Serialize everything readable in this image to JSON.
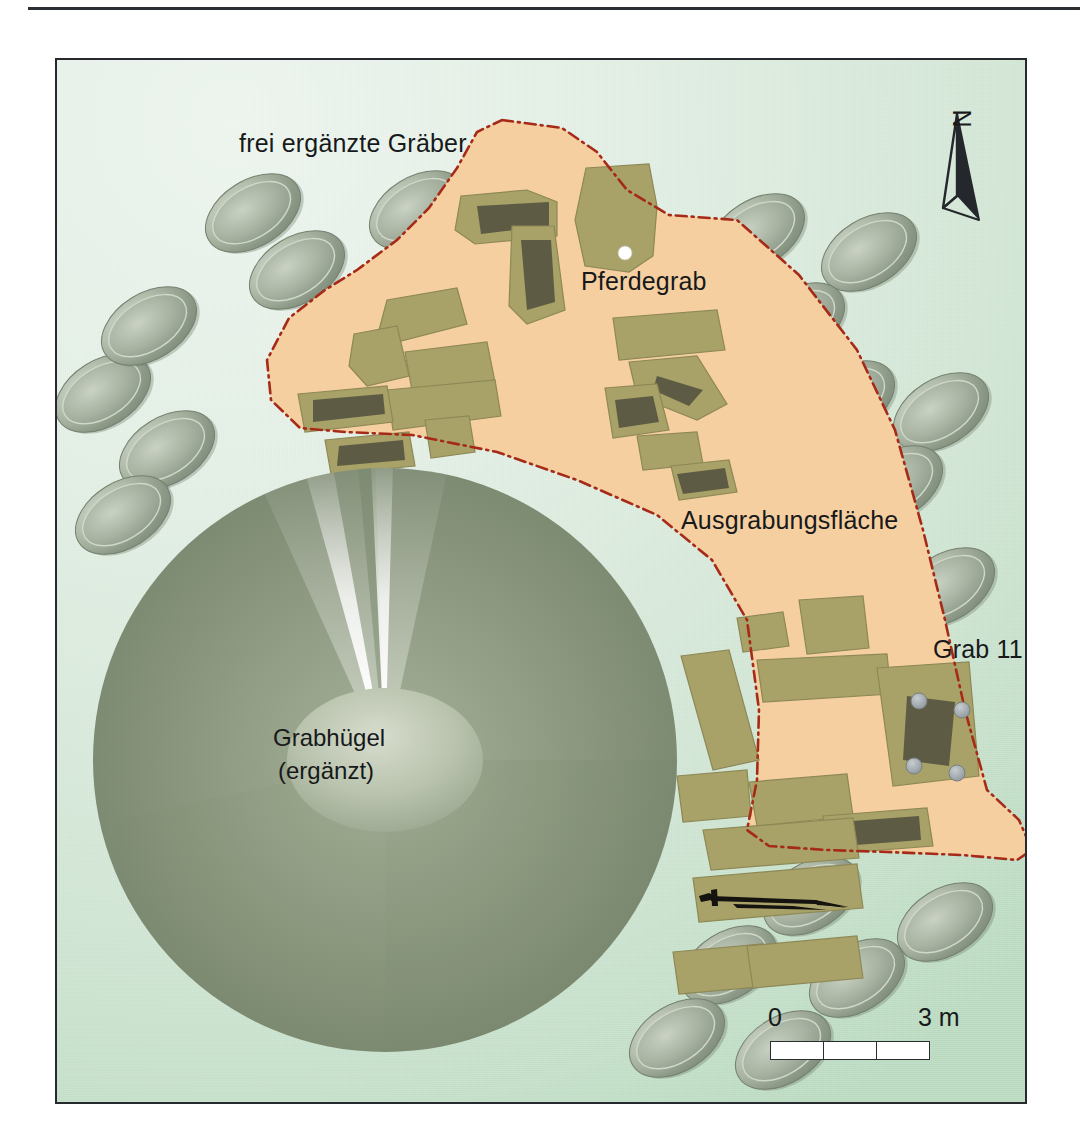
{
  "figure": {
    "kind": "archaeological-site-plan",
    "background_color": "#dbeade",
    "frame_color": "#26292d"
  },
  "labels": {
    "reconstructed_graves": "frei ergänzte Gräber",
    "horse_grave": "Pferdegrab",
    "excavation_area": "Ausgrabungsfläche",
    "grave_11": "Grab 11",
    "mound_line1": "Grabhügel",
    "mound_line2": "(ergänzt)"
  },
  "north_arrow": {
    "letter": "N"
  },
  "scale_bar": {
    "start_label": "0",
    "end_label": "3 m",
    "segments": 3,
    "unit": "m",
    "total_length": 3
  },
  "colors": {
    "excavation_fill": "#f6cfa0",
    "excavation_outline": "#a62a18",
    "grave_fill": "#a8a268",
    "grave_chamber": "#5d5b43",
    "mound_body": "#8e9a80",
    "reconstructed_grave_fill": "#97a391",
    "post_hole": "#9aa3a8",
    "horse_grave_marker": "#ffffff",
    "artifact": "#15130f"
  },
  "excavation_outline_points": "445 60, 505 68, 540 92, 570 130, 612 155, 680 160, 742 215, 800 290, 838 370, 866 470, 888 560, 908 650, 930 730, 962 760, 975 790, 960 800, 905 795, 830 792, 770 790, 712 786, 690 770, 700 720, 702 650, 690 560, 655 500, 600 455, 520 420, 440 392, 355 375, 288 372, 243 368, 214 340, 210 300, 232 258, 268 230, 300 210, 340 180, 372 148, 400 108, 420 72",
  "mound": {
    "center_x": 328,
    "center_y": 700,
    "radius": 292,
    "plateau_rx": 98,
    "plateau_ry": 72
  },
  "horse_grave_marker": {
    "x": 568,
    "y": 193,
    "r": 7
  },
  "grave_11_postholes": [
    {
      "x": 862,
      "y": 641
    },
    {
      "x": 905,
      "y": 650
    },
    {
      "x": 857,
      "y": 706
    },
    {
      "x": 900,
      "y": 713
    }
  ],
  "reconstructed_graves": [
    {
      "cx": 46,
      "cy": 333,
      "rx": 52,
      "ry": 33,
      "rot": -32
    },
    {
      "cx": 92,
      "cy": 266,
      "rx": 52,
      "ry": 33,
      "rot": -32
    },
    {
      "cx": 110,
      "cy": 390,
      "rx": 52,
      "ry": 33,
      "rot": -32
    },
    {
      "cx": 66,
      "cy": 455,
      "rx": 52,
      "ry": 33,
      "rot": -32
    },
    {
      "cx": 240,
      "cy": 210,
      "rx": 52,
      "ry": 33,
      "rot": -32
    },
    {
      "cx": 196,
      "cy": 153,
      "rx": 52,
      "ry": 33,
      "rot": -32
    },
    {
      "cx": 360,
      "cy": 150,
      "rx": 52,
      "ry": 33,
      "rot": -32
    },
    {
      "cx": 403,
      "cy": 208,
      "rx": 52,
      "ry": 33,
      "rot": -32
    },
    {
      "cx": 700,
      "cy": 173,
      "rx": 52,
      "ry": 33,
      "rot": -32
    },
    {
      "cx": 812,
      "cy": 192,
      "rx": 52,
      "ry": 33,
      "rot": -32
    },
    {
      "cx": 740,
      "cy": 262,
      "rx": 52,
      "ry": 33,
      "rot": -32
    },
    {
      "cx": 790,
      "cy": 340,
      "rx": 52,
      "ry": 33,
      "rot": -32
    },
    {
      "cx": 884,
      "cy": 352,
      "rx": 52,
      "ry": 33,
      "rot": -32
    },
    {
      "cx": 838,
      "cy": 425,
      "rx": 52,
      "ry": 33,
      "rot": -32
    },
    {
      "cx": 890,
      "cy": 527,
      "rx": 52,
      "ry": 33,
      "rot": -32
    },
    {
      "cx": 754,
      "cy": 836,
      "rx": 52,
      "ry": 33,
      "rot": -32
    },
    {
      "cx": 888,
      "cy": 862,
      "rx": 52,
      "ry": 33,
      "rot": -32
    },
    {
      "cx": 672,
      "cy": 905,
      "rx": 52,
      "ry": 33,
      "rot": -32
    },
    {
      "cx": 800,
      "cy": 918,
      "rx": 52,
      "ry": 33,
      "rot": -32
    },
    {
      "cx": 620,
      "cy": 978,
      "rx": 52,
      "ry": 33,
      "rot": -32
    },
    {
      "cx": 726,
      "cy": 990,
      "rx": 52,
      "ry": 33,
      "rot": -32
    }
  ],
  "excavated_graves": [
    {
      "id": "g01",
      "points": "404 136, 470 130, 500 142, 500 176, 418 184, 398 170",
      "chamber": "420 146, 492 142, 492 166, 424 174"
    },
    {
      "id": "g02",
      "points": "529 108, 592 104, 600 146, 596 196, 572 212, 528 206, 518 160",
      "chamber": null
    },
    {
      "id": "g03",
      "points": "455 166, 497 166, 508 250, 470 264, 452 246",
      "chamber": "464 180, 494 180, 498 242, 470 250"
    },
    {
      "id": "g04",
      "points": "330 240, 400 228, 410 264, 340 282, 322 270",
      "chamber": null
    },
    {
      "id": "g05",
      "points": "297 274, 340 266, 352 316, 310 326, 292 306",
      "chamber": null
    },
    {
      "id": "g06",
      "points": "348 292, 430 282, 438 322, 356 336",
      "chamber": null
    },
    {
      "id": "g07",
      "points": "330 330, 438 320, 444 356, 336 370",
      "chamber": null
    },
    {
      "id": "g08",
      "points": "241 334, 330 326, 336 362, 248 372",
      "chamber": "256 340, 326 334, 328 354, 256 362"
    },
    {
      "id": "g09",
      "points": "368 360, 412 356, 418 392, 374 398",
      "chamber": null
    },
    {
      "id": "g10",
      "points": "268 380, 352 372, 358 406, 274 414",
      "chamber": "282 386, 346 380, 348 400, 280 406"
    },
    {
      "id": "g11",
      "points": "556 258, 660 250, 668 290, 562 300",
      "chamber": null
    },
    {
      "id": "g12",
      "points": "572 302, 640 296, 670 344, 640 360, 580 336",
      "chamber": "600 316, 646 330, 632 346, 596 330"
    },
    {
      "id": "g13",
      "points": "548 328, 600 324, 612 370, 556 378",
      "chamber": "558 340, 596 336, 602 362, 562 368"
    },
    {
      "id": "g14",
      "points": "580 376, 640 372, 646 404, 586 410",
      "chamber": null
    },
    {
      "id": "g15",
      "points": "614 406, 672 400, 680 432, 622 440",
      "chamber": "620 414, 668 408, 672 428, 626 434"
    },
    {
      "id": "g16",
      "points": "742 540, 806 536, 812 588, 750 594",
      "chamber": null
    },
    {
      "id": "g17",
      "points": "680 558, 726 552, 732 586, 686 592",
      "chamber": null
    },
    {
      "id": "g18",
      "points": "700 600, 830 594, 834 634, 706 642",
      "chamber": null
    },
    {
      "id": "g19",
      "points": "624 596, 672 590, 702 700, 656 710",
      "chamber": null
    },
    {
      "id": "g20",
      "points": "820 608, 912 602, 922 716, 836 726",
      "chamber": "850 636, 898 642, 892 706, 846 700"
    },
    {
      "id": "g21",
      "points": "620 716, 690 710, 694 756, 626 762",
      "chamber": null
    },
    {
      "id": "g22",
      "points": "692 722, 790 714, 796 756, 700 766",
      "chamber": null
    },
    {
      "id": "g23",
      "points": "766 756, 870 748, 876 786, 772 794",
      "chamber": "782 762, 862 756, 864 780, 786 786"
    },
    {
      "id": "g24",
      "points": "646 770, 796 758, 802 798, 654 810",
      "chamber": null
    },
    {
      "id": "g25",
      "points": "636 818, 800 804, 806 848, 642 862",
      "chamber": null
    },
    {
      "id": "g26",
      "points": "616 892, 706 884, 710 926, 622 934",
      "chamber": null
    },
    {
      "id": "g27",
      "points": "690 886, 800 876, 806 918, 696 928",
      "chamber": null
    }
  ],
  "artifact_sword": {
    "description": "sword / weapon outline drawn inside a grave",
    "x": 640,
    "y": 832
  }
}
